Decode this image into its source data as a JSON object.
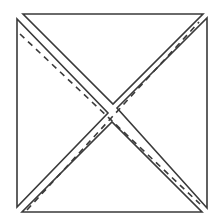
{
  "diagram": {
    "stroke_color": "#3a3a3a",
    "background": "#ffffff",
    "triangles": [
      {
        "name": "top",
        "points": "23,14 203,14 113,104"
      },
      {
        "name": "right",
        "points": "207,18 207,208 117,108"
      },
      {
        "name": "bottom",
        "points": "22,212 202,212 112,122"
      },
      {
        "name": "left",
        "points": "17,19 17,207 108,113"
      }
    ],
    "dashed_lines": [
      {
        "name": "dashed-diagonal-a",
        "x1": 20,
        "y1": 34,
        "x2": 200,
        "y2": 204
      },
      {
        "name": "dashed-diagonal-b",
        "x1": 27,
        "y1": 210,
        "x2": 199,
        "y2": 22
      }
    ]
  }
}
